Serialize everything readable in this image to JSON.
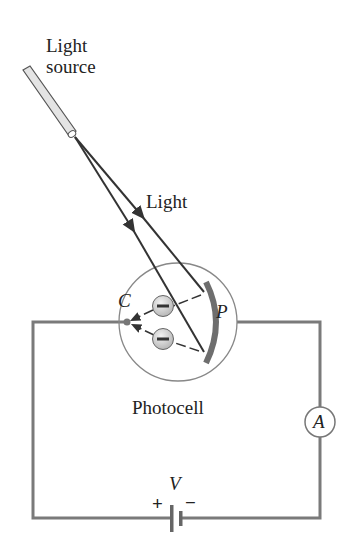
{
  "labels": {
    "light_source_line1": "Light",
    "light_source_line2": "source",
    "light": "Light",
    "cathode": "C",
    "plate": "P",
    "photocell": "Photocell",
    "ammeter": "A",
    "voltage": "V",
    "battery_plus": "+",
    "battery_minus": "−",
    "electron_sign": "−"
  },
  "colors": {
    "wire": "#7a7a7a",
    "ray": "#333333",
    "plate": "#6e6e6e",
    "electron_fill": "#d4d4d4",
    "tube_fill": "#e4e4e4"
  }
}
